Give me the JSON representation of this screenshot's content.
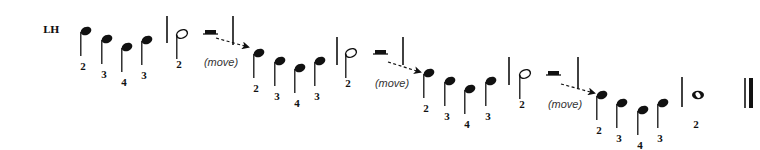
{
  "hand_label": "LH",
  "colors": {
    "ink": "#111111",
    "background": "#ffffff"
  },
  "groups": [
    {
      "notes": [
        {
          "type": "quarter",
          "x": 86,
          "y": 31,
          "finger": "2"
        },
        {
          "type": "quarter",
          "x": 107,
          "y": 39,
          "finger": "3"
        },
        {
          "type": "quarter",
          "x": 127,
          "y": 47,
          "finger": "4"
        },
        {
          "type": "quarter",
          "x": 147,
          "y": 40,
          "finger": "3"
        }
      ],
      "barline": {
        "x": 167,
        "y1": 16,
        "y2": 43
      },
      "long_note": {
        "type": "half",
        "x": 182,
        "y": 34,
        "finger": "2"
      },
      "rest": {
        "type": "half-rest",
        "x": 203,
        "y": 34
      },
      "barline2": {
        "x": 233,
        "y1": 16,
        "y2": 45
      },
      "arrow": {
        "x1": 216,
        "y1": 38,
        "x2": 248,
        "y2": 47
      },
      "move_label": "(move)",
      "move_pos": {
        "x": 221,
        "y": 66
      }
    },
    {
      "notes": [
        {
          "type": "quarter",
          "x": 259,
          "y": 53,
          "finger": "2"
        },
        {
          "type": "quarter",
          "x": 280,
          "y": 61,
          "finger": "3"
        },
        {
          "type": "quarter",
          "x": 300,
          "y": 68,
          "finger": "4"
        },
        {
          "type": "quarter",
          "x": 320,
          "y": 61,
          "finger": "3"
        }
      ],
      "barline": {
        "x": 337,
        "y1": 37,
        "y2": 65
      },
      "long_note": {
        "type": "half",
        "x": 351,
        "y": 53,
        "finger": "2"
      },
      "rest": {
        "type": "half-rest",
        "x": 373,
        "y": 54
      },
      "barline2": {
        "x": 403,
        "y1": 37,
        "y2": 65
      },
      "arrow": {
        "x1": 388,
        "y1": 62,
        "x2": 420,
        "y2": 72
      },
      "move_label": "(move)",
      "move_pos": {
        "x": 392,
        "y": 87
      }
    },
    {
      "notes": [
        {
          "type": "quarter",
          "x": 429,
          "y": 73,
          "finger": "2"
        },
        {
          "type": "quarter",
          "x": 450,
          "y": 81,
          "finger": "3"
        },
        {
          "type": "quarter",
          "x": 470,
          "y": 89,
          "finger": "4"
        },
        {
          "type": "quarter",
          "x": 491,
          "y": 81,
          "finger": "3"
        }
      ],
      "barline": {
        "x": 509,
        "y1": 57,
        "y2": 85
      },
      "long_note": {
        "type": "half",
        "x": 525,
        "y": 74,
        "finger": "2"
      },
      "rest": {
        "type": "half-rest",
        "x": 546,
        "y": 75
      },
      "barline2": {
        "x": 578,
        "y1": 57,
        "y2": 88
      },
      "arrow": {
        "x1": 561,
        "y1": 84,
        "x2": 594,
        "y2": 93
      },
      "move_label": "(move)",
      "move_pos": {
        "x": 565,
        "y": 108
      }
    },
    {
      "notes": [
        {
          "type": "quarter",
          "x": 602,
          "y": 95,
          "finger": "2"
        },
        {
          "type": "quarter",
          "x": 622,
          "y": 103,
          "finger": "3"
        },
        {
          "type": "quarter",
          "x": 643,
          "y": 110,
          "finger": "4"
        },
        {
          "type": "quarter",
          "x": 663,
          "y": 103,
          "finger": "3"
        }
      ],
      "barline": {
        "x": 682,
        "y1": 77,
        "y2": 107
      },
      "long_note": {
        "type": "whole",
        "x": 698,
        "y": 95,
        "finger": "2"
      }
    }
  ],
  "final_barline": {
    "x": 745,
    "y1": 78,
    "y2": 108
  }
}
